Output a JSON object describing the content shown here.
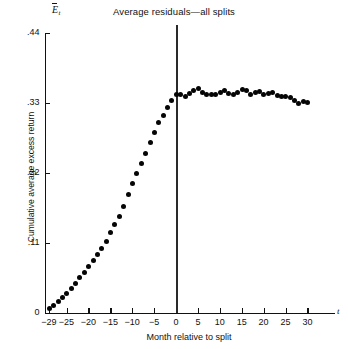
{
  "chart_data": {
    "type": "scatter",
    "title": "Average residuals—all splits",
    "xlabel": "Month relative to split",
    "ylabel": "Cumulative average excess return",
    "x_var_symbol": "t",
    "y_var_symbol": "E",
    "y_var_subscript": "t",
    "xlim": [
      -30,
      31.5
    ],
    "ylim": [
      0,
      0.44
    ],
    "grid": false,
    "legend": null,
    "annotations": [
      {
        "type": "vertical-line",
        "x": 0,
        "label": "split month"
      }
    ],
    "xticks": [
      -29,
      -25,
      -20,
      -15,
      -10,
      -5,
      0,
      5,
      10,
      15,
      20,
      25,
      30
    ],
    "xtick_labels": [
      "−29",
      "−25",
      "−20",
      "−15",
      "−10",
      "−5",
      "0",
      "5",
      "10",
      "15",
      "20",
      "25",
      "30"
    ],
    "yticks": [
      0,
      0.11,
      0.22,
      0.33,
      0.44
    ],
    "ytick_labels": [
      "0",
      ".11",
      ".22",
      ".33",
      ".44"
    ],
    "x": [
      -29,
      -28,
      -27,
      -26,
      -25,
      -24,
      -23,
      -22,
      -21,
      -20,
      -19,
      -18,
      -17,
      -16,
      -15,
      -14,
      -13,
      -12,
      -11,
      -10,
      -9,
      -8,
      -7,
      -6,
      -5,
      -4,
      -3,
      -2,
      -1,
      0,
      1,
      2,
      3,
      4,
      5,
      6,
      7,
      8,
      9,
      10,
      11,
      12,
      13,
      14,
      15,
      16,
      17,
      18,
      19,
      20,
      21,
      22,
      23,
      24,
      25,
      26,
      27,
      28,
      29,
      30
    ],
    "values": [
      0.007,
      0.012,
      0.018,
      0.024,
      0.031,
      0.039,
      0.047,
      0.056,
      0.064,
      0.073,
      0.082,
      0.092,
      0.101,
      0.113,
      0.126,
      0.139,
      0.152,
      0.168,
      0.186,
      0.203,
      0.219,
      0.235,
      0.251,
      0.268,
      0.284,
      0.299,
      0.311,
      0.323,
      0.334,
      0.343,
      0.343,
      0.34,
      0.345,
      0.349,
      0.353,
      0.347,
      0.344,
      0.343,
      0.343,
      0.346,
      0.349,
      0.345,
      0.343,
      0.347,
      0.352,
      0.349,
      0.344,
      0.346,
      0.348,
      0.344,
      0.345,
      0.346,
      0.342,
      0.34,
      0.341,
      0.338,
      0.334,
      0.329,
      0.332,
      0.331
    ]
  }
}
